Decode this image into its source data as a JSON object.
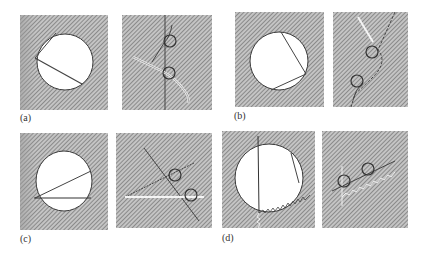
{
  "figure": {
    "hatch": {
      "fill": "#b9b9b9",
      "line": "#6e6e6e",
      "light": "#e4e4e4"
    },
    "stroke_dark": "#3a3a3a",
    "stroke_light": "#f4f4f4",
    "panels": [
      {
        "id": "a",
        "label": "(a)",
        "description": "Circular hole with two chords; rope/seal trace with two loops on a vertical line"
      },
      {
        "id": "b",
        "label": "(b)",
        "description": "Circular hole with two chords meeting at right side; diagonal dashed trace with two loops"
      },
      {
        "id": "c",
        "label": "(c)",
        "description": "Circular hole with horizontal and inclined chords from left point; two lines with loops at crossings"
      },
      {
        "id": "d",
        "label": "(d)",
        "description": "Circular hole with vertical chord and wavy chord; wavy line trace with two loops"
      }
    ]
  }
}
